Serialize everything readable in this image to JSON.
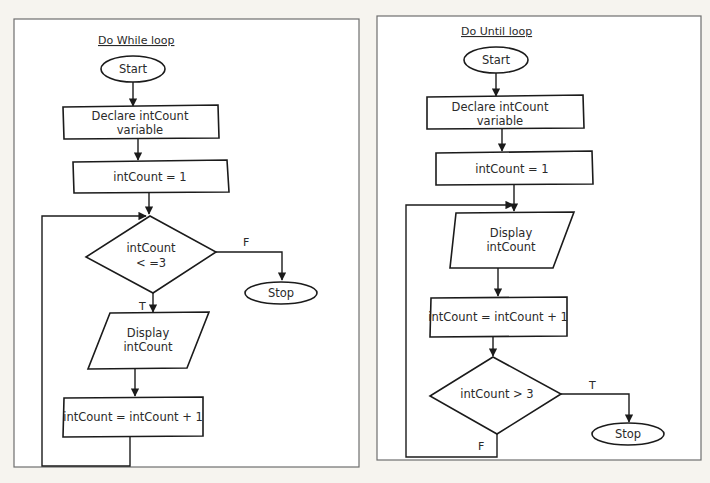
{
  "diagram": {
    "left": {
      "title": "Do While loop",
      "start": "Start",
      "declare_line1": "Declare intCount",
      "declare_line2": "variable",
      "init": "intCount = 1",
      "decision_line1": "intCount",
      "decision_line2": "< =3",
      "false_label": "F",
      "true_label": "T",
      "stop": "Stop",
      "display_line1": "Display",
      "display_line2": "intCount",
      "increment": "intCount = intCount + 1"
    },
    "right": {
      "title": "Do Until loop",
      "start": "Start",
      "declare_line1": "Declare intCount",
      "declare_line2": "variable",
      "init": "intCount = 1",
      "display_line1": "Display",
      "display_line2": "intCount",
      "increment": "intCount = intCount + 1",
      "decision": "intCount > 3",
      "true_label": "T",
      "false_label": "F",
      "stop": "Stop"
    }
  }
}
